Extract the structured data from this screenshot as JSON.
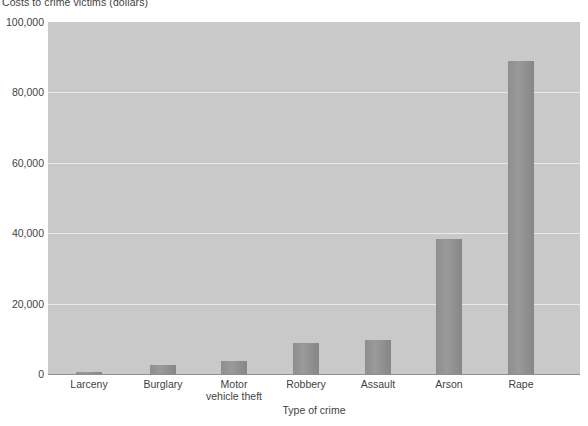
{
  "chart_data": {
    "type": "bar",
    "title": "",
    "xlabel": "Type of crime",
    "ylabel": "Costs to crime victims (dollars)",
    "categories": [
      "Larceny",
      "Burglary",
      "Motor vehicle theft",
      "Robbery",
      "Assault",
      "Arson",
      "Rape"
    ],
    "values": [
      370,
      2600,
      3800,
      8800,
      9700,
      38300,
      88900
    ],
    "ylim": [
      0,
      100000
    ],
    "yticks": [
      0,
      20000,
      40000,
      60000,
      80000,
      100000
    ],
    "ytick_labels": [
      "0",
      "20,000",
      "40,000",
      "60,000",
      "80,000",
      "100,000"
    ],
    "grid": true,
    "legend": "none",
    "plot_background": "#c9c9c9",
    "bar_color": "#909090",
    "gridline_color": "#eceaea",
    "text_color": "#3f3f3f"
  },
  "axis": {
    "y_title": "Costs to crime victims (dollars)",
    "x_title": "Type of crime"
  },
  "xtick_lines": [
    [
      "Larceny"
    ],
    [
      "Burglary"
    ],
    [
      "Motor",
      "vehicle theft"
    ],
    [
      "Robbery"
    ],
    [
      "Assault"
    ],
    [
      "Arson"
    ],
    [
      "Rape"
    ]
  ]
}
